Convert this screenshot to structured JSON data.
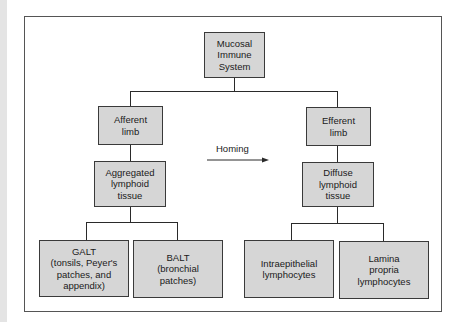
{
  "diagram": {
    "type": "hierarchy",
    "root": {
      "label": "Mucosal\nImmune\nSystem"
    },
    "left_branch": {
      "limb": "Afferent\nlimb",
      "tissue": "Aggregated\nlymphoid\ntissue",
      "children": [
        "GALT\n(tonsils, Peyer's\npatches, and\nappendix)",
        "BALT\n(bronchial\npatches)"
      ]
    },
    "right_branch": {
      "limb": "Efferent\nlimb",
      "tissue": "Diffuse\nlymphoid\ntissue",
      "children": [
        "Intraepithelial\nlymphocytes",
        "Lamina\npropria\nlymphocytes"
      ]
    },
    "arrow": {
      "label": "Homing",
      "direction": "left-to-right"
    },
    "colors": {
      "box_fill": "#d6d6d6",
      "box_border": "#3a3a3a",
      "line": "#2a2a2a",
      "frame": "#555555",
      "background": "#ffffff"
    }
  }
}
